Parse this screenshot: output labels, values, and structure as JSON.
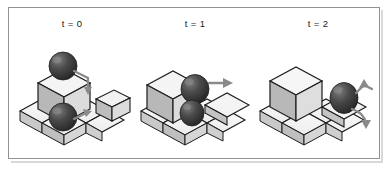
{
  "figure": {
    "kind": "isometric-sequence-diagram",
    "panel_count": 3,
    "border_color": "#8f9396",
    "background_color": "#ffffff"
  },
  "panels": [
    {
      "label": "t = 0",
      "name": "timestep-0",
      "objects": {
        "cubes": 2,
        "spheres": 2,
        "arrows": 2
      }
    },
    {
      "label": "t = 1",
      "name": "timestep-1",
      "objects": {
        "cubes": 2,
        "spheres": 2,
        "arrows": 1
      }
    },
    {
      "label": "t = 2",
      "name": "timestep-2",
      "objects": {
        "cubes": 2,
        "spheres": 1,
        "arrows": 2
      }
    }
  ],
  "palette": {
    "cube_top": "#f2f2f2",
    "cube_left": "#b8b8b8",
    "cube_right": "#dcdcdc",
    "tile_fill": "#f4f4f4",
    "tile_edge": "#1c1c1c",
    "wall_fill": "#c9c9c9",
    "sphere_dark": "#2f2f2f",
    "sphere_mid": "#4a4a4a",
    "sphere_light": "#6f6f6f",
    "arrow_gray": "#8a8a8a",
    "outline": "#1c1c1c",
    "label_text": "#1b1b1b"
  }
}
